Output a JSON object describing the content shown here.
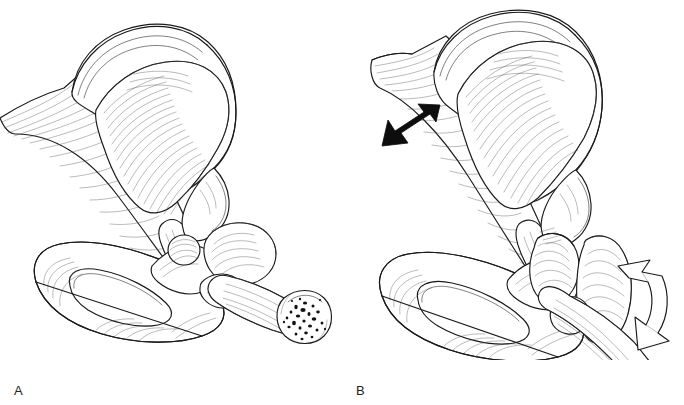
{
  "figure": {
    "type": "anatomical-line-illustration",
    "background_color": "#ffffff",
    "ink_color": "#1a1a1a",
    "panel_count": 2
  },
  "panels": [
    {
      "id": "A",
      "label": "A",
      "description": "Pelvis and proximal femur with intact musculature; femoral shaft shown in cut cross-section exposing cancellous bone and marrow",
      "has_black_arrow": false,
      "has_white_arrow": false,
      "structures": [
        "iliac crest",
        "ilium wing",
        "gluteal muscle fan",
        "oblique muscle band",
        "anterior superior iliac spine",
        "acetabulum",
        "femoral head",
        "femoral neck",
        "greater trochanter",
        "lesser trochanter",
        "femoral shaft cut cross-section",
        "obturator foramen",
        "superior pubic ramus",
        "inferior pubic ramus",
        "ischial tuberosity"
      ]
    },
    {
      "id": "B",
      "label": "B",
      "description": "Same hip with fractured and displaced proximal femur; muscle traction shortens and rotates the limb",
      "has_black_arrow": true,
      "has_white_arrow": true,
      "black_arrow": {
        "name": "muscle-pull-arrow",
        "color": "#0d0d0d",
        "style": "solid filled",
        "direction": "down-left",
        "meaning": "direction of proximal muscle pull"
      },
      "white_arrow": {
        "name": "limb-rotation-arrow",
        "color": "#ffffff",
        "outline_color": "#1a1a1a",
        "style": "open outlined",
        "direction": "downward-curving",
        "meaning": "external rotation of the distal limb"
      },
      "structures": [
        "iliac crest",
        "ilium wing",
        "gluteal muscle fan",
        "oblique muscle band under traction",
        "acetabulum",
        "displaced femoral head",
        "fractured femoral neck",
        "greater trochanter",
        "lesser trochanter",
        "femoral shaft",
        "obturator foramen",
        "superior pubic ramus",
        "inferior pubic ramus",
        "ischial tuberosity"
      ]
    }
  ]
}
